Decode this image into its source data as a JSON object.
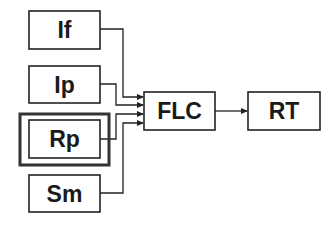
{
  "diagram": {
    "type": "block-diagram",
    "nodes": [
      {
        "id": "If",
        "label": "If"
      },
      {
        "id": "Ip",
        "label": "Ip"
      },
      {
        "id": "Rp",
        "label": "Rp",
        "highlighted": true
      },
      {
        "id": "Sm",
        "label": "Sm"
      },
      {
        "id": "FLC",
        "label": "FLC"
      },
      {
        "id": "RT",
        "label": "RT"
      }
    ],
    "edges": [
      {
        "from": "If",
        "to": "FLC"
      },
      {
        "from": "Ip",
        "to": "FLC"
      },
      {
        "from": "Rp",
        "to": "FLC"
      },
      {
        "from": "Sm",
        "to": "FLC"
      },
      {
        "from": "FLC",
        "to": "RT"
      }
    ],
    "colors": {
      "stroke": "#222222",
      "background": "#ffffff",
      "highlight": "#333333"
    }
  }
}
